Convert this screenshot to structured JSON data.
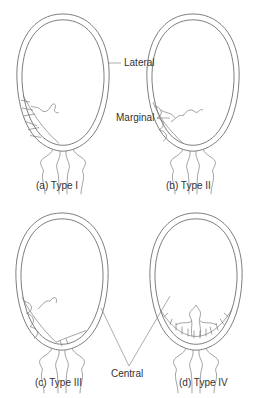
{
  "figure": {
    "panels": [
      {
        "id": "a",
        "caption": "(a) Type I"
      },
      {
        "id": "b",
        "caption": "(b) Type II"
      },
      {
        "id": "c",
        "caption": "(c) Type III"
      },
      {
        "id": "d",
        "caption": "(d) Type IV"
      }
    ],
    "annotations": {
      "lateral": "Lateral",
      "marginal": "Marginal",
      "central": "Central"
    },
    "colors": {
      "line": "#6e6e6e",
      "text": "#333333",
      "background": "#ffffff"
    }
  }
}
